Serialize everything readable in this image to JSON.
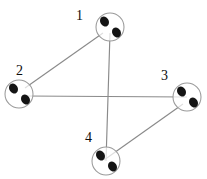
{
  "figure": {
    "name": "four-node-graph",
    "width": 207,
    "height": 179,
    "background_color": "#ffffff",
    "line_color": "#8a8a8a",
    "circle_stroke_color": "#9a9a9a",
    "dot_color": "#141414",
    "label_color": "#0d0d0d"
  },
  "nodes": [
    {
      "id": "1",
      "label": "1",
      "cx": 110,
      "cy": 27,
      "r": 14,
      "label_x": 76,
      "label_y": 9,
      "dots": [
        {
          "cx": 104.5,
          "cy": 21.5,
          "rx": 4.2,
          "ry": 5.2,
          "rotate": -32
        },
        {
          "cx": 116.5,
          "cy": 32.5,
          "rx": 4.2,
          "ry": 5.2,
          "rotate": -32
        }
      ]
    },
    {
      "id": "2",
      "label": "2",
      "cx": 19,
      "cy": 94,
      "r": 14,
      "label_x": 16,
      "label_y": 64,
      "dots": [
        {
          "cx": 13.5,
          "cy": 88.5,
          "rx": 4.2,
          "ry": 5.2,
          "rotate": -32
        },
        {
          "cx": 25.5,
          "cy": 99.5,
          "rx": 4.2,
          "ry": 5.2,
          "rotate": -32
        }
      ]
    },
    {
      "id": "3",
      "label": "3",
      "cx": 187,
      "cy": 97,
      "r": 14,
      "label_x": 161,
      "label_y": 69,
      "dots": [
        {
          "cx": 181.5,
          "cy": 91.5,
          "rx": 4.2,
          "ry": 5.2,
          "rotate": -32
        },
        {
          "cx": 193.5,
          "cy": 102.5,
          "rx": 4.2,
          "ry": 5.2,
          "rotate": -32
        }
      ]
    },
    {
      "id": "4",
      "label": "4",
      "cx": 106,
      "cy": 161,
      "r": 14,
      "label_x": 85,
      "label_y": 131,
      "dots": [
        {
          "cx": 100.5,
          "cy": 155.5,
          "rx": 4.2,
          "ry": 5.2,
          "rotate": -32
        },
        {
          "cx": 112.5,
          "cy": 166.5,
          "rx": 4.2,
          "ry": 5.2,
          "rotate": -32
        }
      ]
    }
  ],
  "edges": [
    {
      "id": "edge-1-2",
      "from": "1",
      "to": "2",
      "x1": 103,
      "y1": 33,
      "x2": 25,
      "y2": 88
    },
    {
      "id": "edge-2-3",
      "from": "2",
      "to": "3",
      "x1": 25,
      "y1": 96,
      "x2": 187,
      "y2": 97
    },
    {
      "id": "edge-1-4",
      "from": "1",
      "to": "4",
      "x1": 110,
      "y1": 33,
      "x2": 106,
      "y2": 161
    },
    {
      "id": "edge-3-4",
      "from": "3",
      "to": "4",
      "x1": 183,
      "y1": 104,
      "x2": 104,
      "y2": 160
    }
  ],
  "chart_data": {
    "type": "diagram",
    "title": "",
    "node_labels": [
      "1",
      "2",
      "3",
      "4"
    ],
    "node_positions": [
      [
        110,
        27
      ],
      [
        19,
        94
      ],
      [
        187,
        97
      ],
      [
        106,
        161
      ]
    ],
    "edge_list": [
      [
        "1",
        "2"
      ],
      [
        "2",
        "3"
      ],
      [
        "1",
        "4"
      ],
      [
        "3",
        "4"
      ]
    ],
    "edge_count": 4,
    "node_count": 4,
    "dots_per_node": 2
  }
}
